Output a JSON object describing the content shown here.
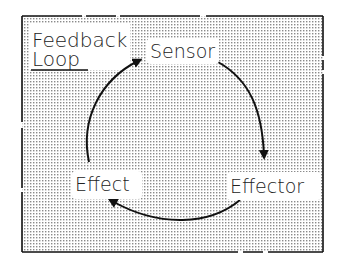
{
  "title": {
    "line1": "Feedback",
    "line2": "Loop"
  },
  "nodes": [
    {
      "id": "sensor",
      "label": "Sensor"
    },
    {
      "id": "effector",
      "label": "Effector"
    },
    {
      "id": "effect",
      "label": "Effect"
    }
  ],
  "edges": [
    {
      "from": "sensor",
      "to": "effector"
    },
    {
      "from": "effector",
      "to": "effect"
    },
    {
      "from": "effect",
      "to": "sensor"
    }
  ],
  "colors": {
    "ink": "#111111",
    "background": "#ffffff"
  }
}
